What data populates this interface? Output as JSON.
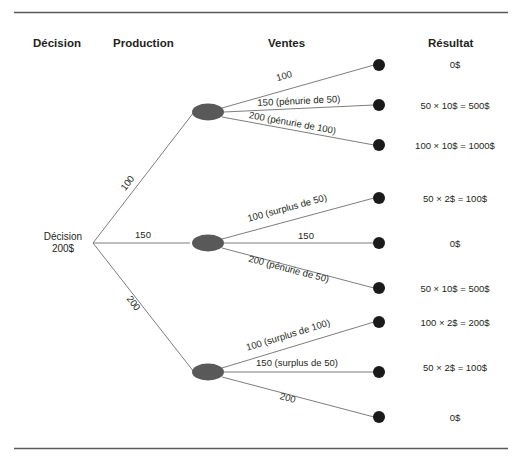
{
  "figure": {
    "type": "decision-tree",
    "language": "fr",
    "headers": [
      {
        "label": "Décision",
        "x": 33
      },
      {
        "label": "Production",
        "x": 113
      },
      {
        "label": "Ventes",
        "x": 268
      },
      {
        "label": "Résultat",
        "x": 428
      }
    ],
    "root": {
      "line1": "Décision",
      "line2": "200$"
    },
    "decision_branches": [
      {
        "label": "100"
      },
      {
        "label": "150"
      },
      {
        "label": "200"
      }
    ],
    "groups": [
      {
        "production": "100",
        "sales_branches": [
          {
            "label": "100",
            "result": "0$"
          },
          {
            "label": "150 (pénurie de 50)",
            "result": "50 × 10$ = 500$"
          },
          {
            "label": "200 (pénurie de 100)",
            "result": "100 × 10$ = 1000$"
          }
        ]
      },
      {
        "production": "150",
        "sales_branches": [
          {
            "label": "100 (surplus de 50)",
            "result": "50 × 2$ = 100$"
          },
          {
            "label": "150",
            "result": "0$"
          },
          {
            "label": "200 (pénurie de 50)",
            "result": "50 × 10$ = 500$"
          }
        ]
      },
      {
        "production": "200",
        "sales_branches": [
          {
            "label": "100 (surplus de 100)",
            "result": "100 × 2$ = 200$"
          },
          {
            "label": "150 (surplus de 50)",
            "result": "50 × 2$ = 100$"
          },
          {
            "label": "200",
            "result": "0$"
          }
        ]
      }
    ],
    "colors": {
      "chance_node": "#595959",
      "terminal_node": "#1a1a1a",
      "branch_line": "#6d6e71",
      "rule": "#58595b",
      "text": "#231f20"
    }
  }
}
